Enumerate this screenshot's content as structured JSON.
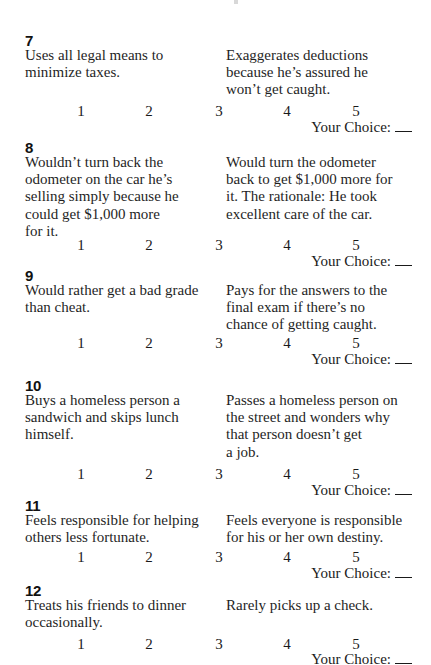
{
  "scale_labels": [
    "1",
    "2",
    "3",
    "4",
    "5"
  ],
  "choice_label": "Your Choice:",
  "choice_value": "",
  "items": [
    {
      "number": "7",
      "left": [
        "Uses all legal means to",
        "minimize taxes."
      ],
      "right": [
        "Exaggerates deductions",
        "because he’s assured he",
        "won’t get caught."
      ]
    },
    {
      "number": "8",
      "left": [
        "Wouldn’t turn back the",
        "odometer on the car he’s",
        "selling simply because he",
        "could get $1,000 more",
        "for it."
      ],
      "right": [
        "Would turn the odometer",
        "back to get $1,000 more for",
        "it. The rationale: He took",
        "excellent care of the car."
      ]
    },
    {
      "number": "9",
      "left": [
        "Would rather get a bad grade",
        "than cheat."
      ],
      "right": [
        "Pays for the answers to the",
        "final exam if there’s no",
        "chance of getting caught."
      ]
    },
    {
      "number": "10",
      "left": [
        "Buys a homeless person a",
        "sandwich and skips lunch",
        "himself."
      ],
      "right": [
        "Passes a homeless person on",
        "the street and wonders why",
        "that person doesn’t get",
        "a job."
      ]
    },
    {
      "number": "11",
      "left": [
        "Feels responsible for helping",
        "others less fortunate."
      ],
      "right": [
        "Feels everyone is responsible",
        "for his or her own destiny."
      ]
    },
    {
      "number": "12",
      "left": [
        "Treats his friends to dinner",
        "occasionally."
      ],
      "right": [
        "Rarely picks up a check."
      ]
    }
  ]
}
